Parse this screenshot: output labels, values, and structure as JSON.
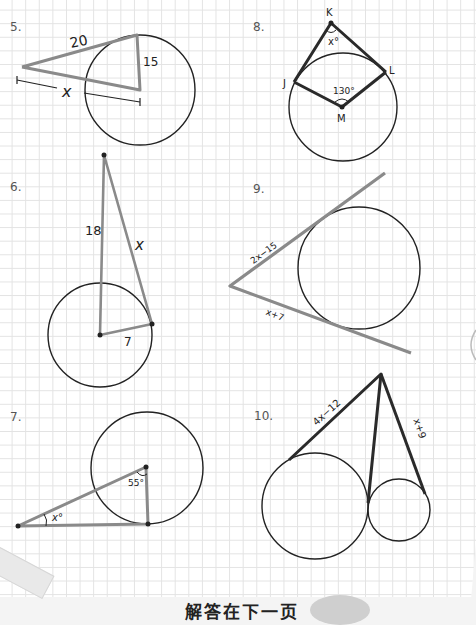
{
  "page": {
    "type": "geometry worksheet - tangent lines to circles",
    "footer_text": "解答在下一页"
  },
  "problems": [
    {
      "number": "5.",
      "labels": {
        "side_tangent": "20",
        "radius": "15",
        "distance_to_center": "x"
      }
    },
    {
      "number": "6.",
      "labels": {
        "distance_to_center": "18",
        "tangent": "x",
        "radius": "7"
      }
    },
    {
      "number": "7.",
      "labels": {
        "angle_at_external_point": "x°",
        "angle_at_center": "55°"
      }
    },
    {
      "number": "8.",
      "labels": {
        "vertex_top": "K",
        "vertex_left": "J",
        "vertex_right": "L",
        "center": "M",
        "angle_at_K": "x°",
        "central_angle": "130°"
      }
    },
    {
      "number": "9.",
      "labels": {
        "upper_tangent": "2x−15",
        "lower_tangent": "x+7"
      }
    },
    {
      "number": "10.",
      "labels": {
        "left_tangent": "4x−12",
        "right_tangent": "x+9"
      }
    }
  ],
  "colors": {
    "gray_segment": "#8a8a8a",
    "dark_segment": "#2a2a2a",
    "circle_stroke": "#222222",
    "grid": "#e3e3e3"
  }
}
